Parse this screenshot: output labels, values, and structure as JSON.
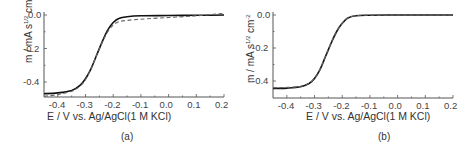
{
  "chart_data": [
    {
      "type": "line",
      "panel_label": "(a)",
      "xlabel": "E / V vs. Ag/AgCl(1 M KCl)",
      "ylabel": "m / mA s^1/2 cm^-2",
      "ylabel_parts": {
        "main": "m / mA s",
        "sup1": "1/2",
        "mid": " cm",
        "sup2": "-2"
      },
      "xlim": [
        -0.45,
        0.2
      ],
      "ylim": [
        -0.49,
        0.02
      ],
      "xticks": [
        "-0.4",
        "-0.3",
        "-0.2",
        "-0.1",
        "0.0",
        "0.1",
        "0.2"
      ],
      "yticks": [
        "0.0",
        "-0.2",
        "-0.4"
      ],
      "grid": false,
      "series": [
        {
          "name": "experimental",
          "style": "solid",
          "x": [
            -0.45,
            -0.4,
            -0.35,
            -0.32,
            -0.3,
            -0.28,
            -0.26,
            -0.24,
            -0.22,
            -0.2,
            -0.18,
            -0.15,
            -0.1,
            0.0,
            0.1,
            0.2
          ],
          "y": [
            -0.47,
            -0.465,
            -0.45,
            -0.42,
            -0.38,
            -0.32,
            -0.24,
            -0.16,
            -0.09,
            -0.045,
            -0.02,
            -0.01,
            -0.005,
            -0.003,
            -0.002,
            0.0
          ]
        },
        {
          "name": "fit",
          "style": "dashed",
          "x": [
            -0.45,
            -0.4,
            -0.35,
            -0.32,
            -0.3,
            -0.28,
            -0.26,
            -0.24,
            -0.22,
            -0.2,
            -0.18,
            -0.15,
            -0.1,
            0.0,
            0.1,
            0.2
          ],
          "y": [
            -0.485,
            -0.475,
            -0.455,
            -0.425,
            -0.385,
            -0.32,
            -0.24,
            -0.165,
            -0.1,
            -0.06,
            -0.04,
            -0.032,
            -0.025,
            -0.015,
            -0.005,
            0.01
          ]
        }
      ]
    },
    {
      "type": "line",
      "panel_label": "(b)",
      "xlabel": "E / V vs. Ag/AgCl(1 M KCl)",
      "ylabel": "m / mA s^1/2 cm^-2",
      "ylabel_parts": {
        "main": "m / mA s",
        "sup1": "1/2",
        "mid": " cm",
        "sup2": "-2"
      },
      "xlim": [
        -0.45,
        0.2
      ],
      "ylim": [
        -0.5,
        0.02
      ],
      "xticks": [
        "-0.4",
        "-0.3",
        "-0.2",
        "-0.1",
        "0.0",
        "0.1",
        "0.2"
      ],
      "yticks": [
        "0.0",
        "-0.2",
        "-0.4"
      ],
      "grid": false,
      "series": [
        {
          "name": "experimental",
          "style": "solid",
          "x": [
            -0.45,
            -0.4,
            -0.35,
            -0.32,
            -0.3,
            -0.28,
            -0.26,
            -0.24,
            -0.22,
            -0.2,
            -0.18,
            -0.15,
            -0.1,
            0.0,
            0.1,
            0.2
          ],
          "y": [
            -0.445,
            -0.443,
            -0.435,
            -0.415,
            -0.385,
            -0.33,
            -0.25,
            -0.17,
            -0.1,
            -0.05,
            -0.018,
            -0.004,
            -0.001,
            0.0,
            0.0,
            0.0
          ]
        },
        {
          "name": "fit",
          "style": "dashed",
          "x": [
            -0.45,
            -0.4,
            -0.35,
            -0.32,
            -0.3,
            -0.28,
            -0.26,
            -0.24,
            -0.22,
            -0.2,
            -0.18,
            -0.15,
            -0.1,
            0.0,
            0.1,
            0.2
          ],
          "y": [
            -0.44,
            -0.439,
            -0.432,
            -0.413,
            -0.382,
            -0.328,
            -0.248,
            -0.168,
            -0.099,
            -0.05,
            -0.018,
            -0.004,
            -0.001,
            0.0,
            0.0,
            0.0
          ]
        }
      ]
    }
  ]
}
